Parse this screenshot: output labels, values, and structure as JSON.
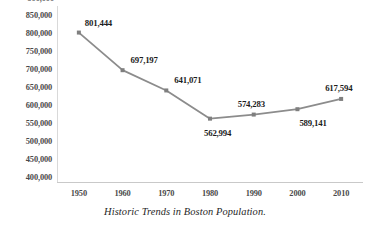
{
  "chart_data": {
    "type": "line",
    "title": "",
    "caption": "Historic Trends in Boston Population.",
    "xlabel": "",
    "ylabel": "",
    "categories": [
      "1950",
      "1960",
      "1970",
      "1980",
      "1990",
      "2000",
      "2010"
    ],
    "x": [
      1950,
      1960,
      1970,
      1980,
      1990,
      2000,
      2010
    ],
    "values": [
      801444,
      697197,
      641071,
      562994,
      574283,
      589141,
      617594
    ],
    "point_labels": [
      "801,444",
      "697,197",
      "641,071",
      "562,994",
      "574,283",
      "589,141",
      "617,594"
    ],
    "ylim": [
      400000,
      850000
    ],
    "ytick_labels": [
      "850,000",
      "800,000",
      "750,000",
      "700,000",
      "650,000",
      "600,000",
      "550,000",
      "500,000",
      "450,000",
      "400,000"
    ],
    "ytick_values": [
      850000,
      800000,
      750000,
      700000,
      650000,
      600000,
      550000,
      500000,
      450000,
      400000
    ],
    "ytick_step": 50000,
    "clipped_top_ytick_label": "900,000",
    "grid": false,
    "legend": false,
    "series": [
      {
        "name": "Boston Population",
        "values": [
          801444,
          697197,
          641071,
          562994,
          574283,
          589141,
          617594
        ]
      }
    ],
    "colors": {
      "line": "#8c8c8c",
      "marker": "#7f7f7f",
      "axis": "#c9c9c9",
      "tick_text": "#4a4a4a",
      "label_text": "#1c1c1c",
      "background": "#ffffff"
    },
    "label_offsets": [
      {
        "dx": 6,
        "dy": -15
      },
      {
        "dx": 8,
        "dy": -15
      },
      {
        "dx": 8,
        "dy": -15
      },
      {
        "dx": -6,
        "dy": 9
      },
      {
        "dx": -16,
        "dy": -16
      },
      {
        "dx": 2,
        "dy": 9
      },
      {
        "dx": -16,
        "dy": -16
      }
    ]
  }
}
